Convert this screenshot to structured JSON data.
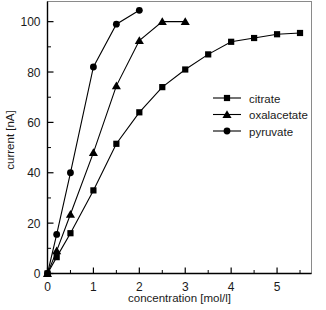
{
  "chart_data": {
    "type": "line",
    "title": "",
    "xlabel": "concentration [mol/l]",
    "ylabel": "current [nA]",
    "xlim": [
      0,
      5.75
    ],
    "ylim": [
      0,
      108
    ],
    "grid": false,
    "legend_position": "center-right inside axes",
    "xticks": [
      0,
      1,
      2,
      3,
      4,
      5
    ],
    "xtick_labels": [
      "0",
      "1",
      "2",
      "3",
      "4",
      "5"
    ],
    "xticks_minor": [
      0.5,
      1.5,
      2.5,
      3.5,
      4.5,
      5.5
    ],
    "yticks": [
      0,
      20,
      40,
      60,
      80,
      100
    ],
    "ytick_labels": [
      "0",
      "20",
      "40",
      "60",
      "80",
      "100"
    ],
    "yticks_minor": [
      10,
      30,
      50,
      70,
      90
    ],
    "series": [
      {
        "name": "citrate",
        "marker": "square",
        "color": "#000000",
        "x": [
          0,
          0.2,
          0.5,
          1.0,
          1.5,
          2.0,
          2.5,
          3.0,
          3.5,
          4.0,
          4.5,
          5.0,
          5.5
        ],
        "y": [
          0,
          6.5,
          16,
          33,
          51.5,
          64,
          74,
          81,
          87,
          92,
          93.5,
          95,
          95.5
        ]
      },
      {
        "name": "oxalacetate",
        "marker": "triangle",
        "color": "#000000",
        "x": [
          0,
          0.2,
          0.5,
          1.0,
          1.5,
          2.0,
          2.5,
          3.0
        ],
        "y": [
          0,
          9,
          23.5,
          48,
          74.5,
          92.5,
          100,
          100
        ]
      },
      {
        "name": "pyruvate",
        "marker": "circle",
        "color": "#000000",
        "x": [
          0,
          0.2,
          0.5,
          1.0,
          1.5,
          2.0
        ],
        "y": [
          0,
          15.5,
          40,
          82,
          99,
          104.5
        ]
      }
    ]
  },
  "legend": {
    "entries": [
      {
        "label": "citrate",
        "marker": "square"
      },
      {
        "label": "oxalacetate",
        "marker": "triangle"
      },
      {
        "label": "pyruvate",
        "marker": "circle"
      }
    ]
  },
  "axes": {
    "x_title": "concentration [mol/l]",
    "y_title": "current [nA]"
  }
}
